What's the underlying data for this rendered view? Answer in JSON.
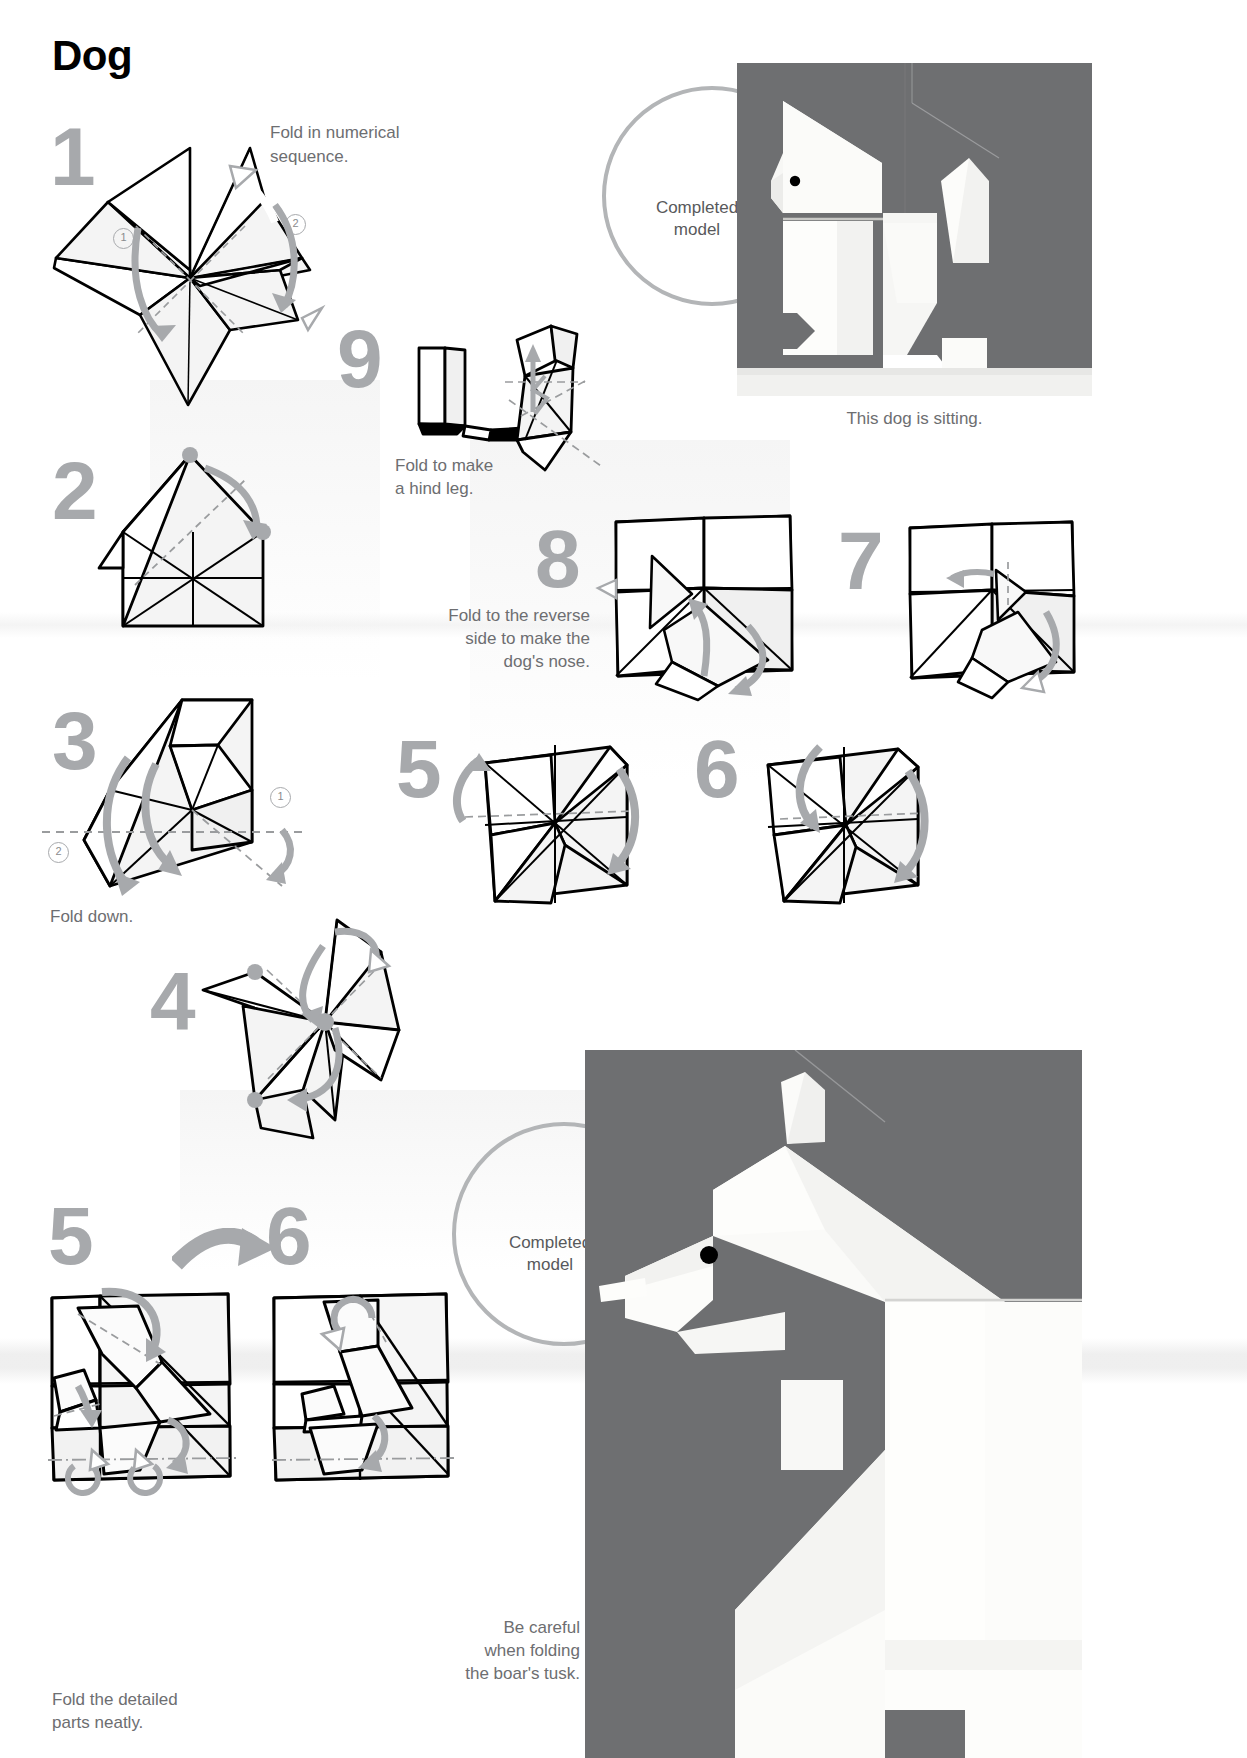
{
  "page": {
    "title": "Dog",
    "width": 1247,
    "height": 1758,
    "colors": {
      "step_number_gray": "#a7a9ac",
      "caption_gray": "#6d6e71",
      "ring_gray": "#b3b5b7",
      "photo_background_gray": "#6e6f71",
      "paper_white": "#ffffff",
      "ink_black": "#000000"
    }
  },
  "steps": [
    {
      "id": "step-1",
      "number": "1",
      "caption": "Fold in numerical sequence.",
      "sub_numbers": [
        "1",
        "2"
      ]
    },
    {
      "id": "step-2",
      "number": "2",
      "caption": ""
    },
    {
      "id": "step-3",
      "number": "3",
      "caption": "Fold down.",
      "sub_numbers": [
        "1",
        "2"
      ]
    },
    {
      "id": "step-4",
      "number": "4",
      "caption": ""
    },
    {
      "id": "step-5",
      "number": "5",
      "caption": ""
    },
    {
      "id": "step-6",
      "number": "6",
      "caption": ""
    },
    {
      "id": "step-7",
      "number": "7",
      "caption": ""
    },
    {
      "id": "step-8",
      "number": "8",
      "caption": "Fold to the reverse side to make the dog's nose."
    },
    {
      "id": "step-9",
      "number": "9",
      "caption": "Fold to make a hind leg."
    }
  ],
  "bottom_steps": [
    {
      "id": "bottom-step-5",
      "number": "5",
      "caption": "Fold the detailed parts neatly."
    },
    {
      "id": "bottom-step-6",
      "number": "6",
      "caption": ""
    }
  ],
  "completed_models": [
    {
      "id": "completed-model-dog",
      "label": "Completed\nmodel",
      "label_line1": "Completed",
      "label_line2": "model",
      "caption": "This dog is sitting."
    },
    {
      "id": "completed-model-boar",
      "label": "Completed\nmodel",
      "label_line1": "Completed",
      "label_line2": "model",
      "caption": "Be careful when folding the boar's tusk.",
      "caption_line1": "Be careful",
      "caption_line2": "when folding",
      "caption_line3": "the boar's tusk."
    }
  ],
  "captions": {
    "step1": "Fold in numerical sequence.",
    "step1_line1": "Fold in numerical",
    "step1_line2": "sequence.",
    "step3": "Fold down.",
    "step8_line1": "Fold to the reverse",
    "step8_line2": "side to make the",
    "step8_line3": "dog's nose.",
    "step9_line1": "Fold to make",
    "step9_line2": "a hind leg.",
    "bottom5_line1": "Fold the detailed",
    "bottom5_line2": "parts neatly.",
    "dog_photo": "This dog is sitting.",
    "boar_line1": "Be careful",
    "boar_line2": "when folding",
    "boar_line3": "the boar's tusk."
  },
  "icons": {
    "transition_arrow": "fat-arrow-right-icon",
    "fold_arrow": "curved-fold-arrow-icon",
    "valley_fold": "dashed-line-icon",
    "mountain_fold": "dash-dot-line-icon"
  }
}
